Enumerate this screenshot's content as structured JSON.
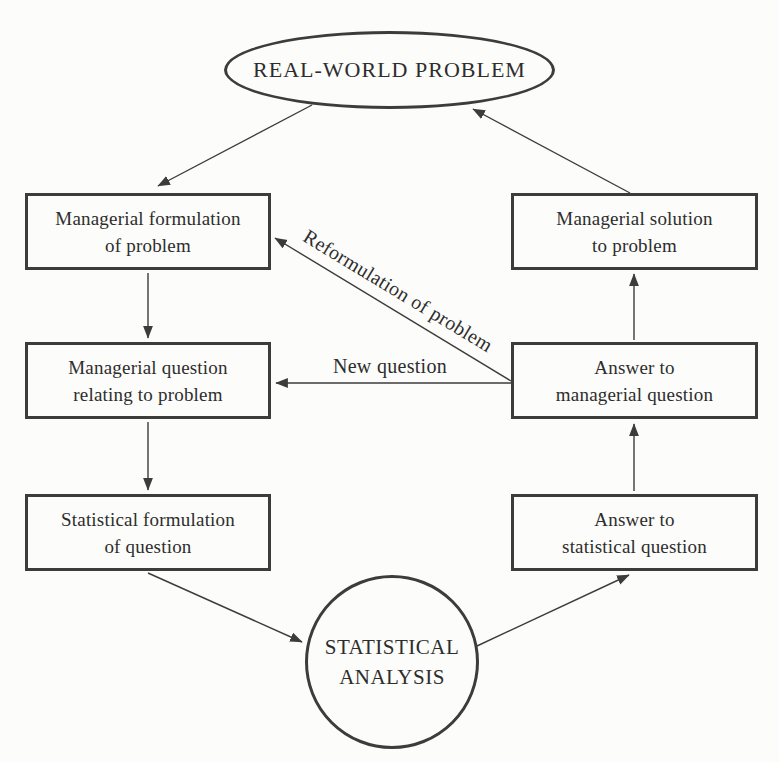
{
  "diagram": {
    "type": "flowchart",
    "colors": {
      "background": "#fcfcfa",
      "ink": "#3c3c3c",
      "text": "#2d2d2d"
    },
    "nodes": {
      "real_world_problem": {
        "shape": "ellipse",
        "label": "REAL-WORLD PROBLEM"
      },
      "managerial_formulation": {
        "shape": "rect",
        "line1": "Managerial formulation",
        "line2": "of problem"
      },
      "managerial_question": {
        "shape": "rect",
        "line1": "Managerial question",
        "line2": "relating to problem"
      },
      "statistical_formulation": {
        "shape": "rect",
        "line1": "Statistical formulation",
        "line2": "of question"
      },
      "managerial_solution": {
        "shape": "rect",
        "line1": "Managerial solution",
        "line2": "to problem"
      },
      "answer_managerial": {
        "shape": "rect",
        "line1": "Answer to",
        "line2": "managerial question"
      },
      "answer_statistical": {
        "shape": "rect",
        "line1": "Answer to",
        "line2": "statistical question"
      },
      "statistical_analysis": {
        "shape": "circle",
        "line1": "STATISTICAL",
        "line2": "ANALYSIS"
      }
    },
    "edge_labels": {
      "reformulation": "Reformulation of problem",
      "new_question": "New question"
    }
  }
}
